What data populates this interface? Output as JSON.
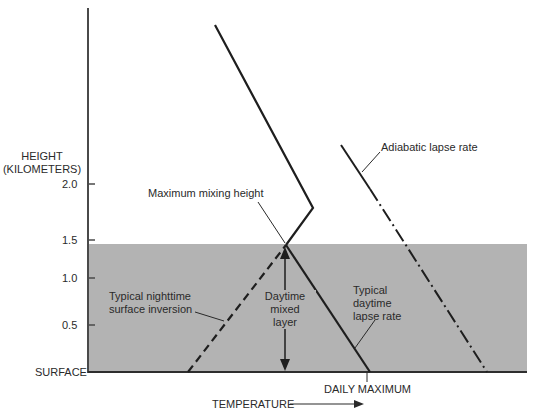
{
  "diagram": {
    "y_axis": {
      "title_line1": "HEIGHT",
      "title_line2": "(KILOMETERS)",
      "ticks": [
        "2.0",
        "1.5",
        "1.0",
        "0.5"
      ],
      "surface_label": "SURFACE"
    },
    "x_axis": {
      "label": "TEMPERATURE",
      "daily_maximum_label": "DAILY MAXIMUM"
    },
    "annotations": {
      "max_mixing_height": "Maximum mixing height",
      "adiabatic": "Adiabatic lapse rate",
      "nighttime_line1": "Typical nighttime",
      "nighttime_line2": "surface inversion",
      "mixed_layer_line1": "Daytime",
      "mixed_layer_line2": "mixed",
      "mixed_layer_line3": "layer",
      "daytime_line1": "Typical",
      "daytime_line2": "daytime",
      "daytime_line3": "lapse rate"
    },
    "colors": {
      "mixed_layer_fill": "#b3b3b3",
      "line": "#1e1e1e",
      "axis": "#555555"
    }
  }
}
